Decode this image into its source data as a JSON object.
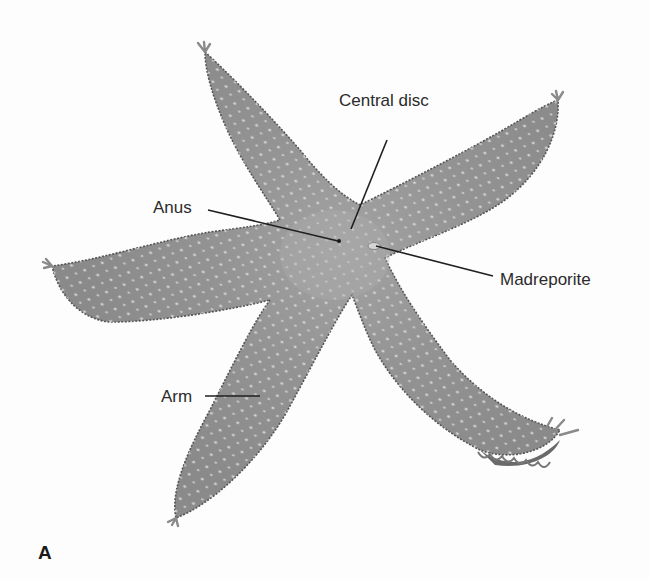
{
  "figure": {
    "panel_letter": "A",
    "colors": {
      "body": "#8f8f8f",
      "body_light": "#a5a5a5",
      "outline": "#555555",
      "tubercle": "#d6d6d6",
      "leader_line": "#1f1f1f",
      "background": "#fdfdfd"
    },
    "labels": [
      {
        "id": "central-disc",
        "text": "Central disc"
      },
      {
        "id": "anus",
        "text": "Anus"
      },
      {
        "id": "madreporite",
        "text": "Madreporite"
      },
      {
        "id": "arm",
        "text": "Arm"
      }
    ]
  }
}
